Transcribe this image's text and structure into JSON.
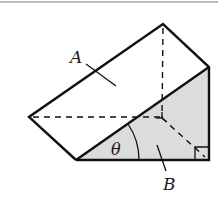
{
  "figure": {
    "labels": {
      "face_a": "A",
      "face_b": "B",
      "angle": "θ"
    },
    "colors": {
      "stroke": "#111111",
      "shaded_face": "#dcdcdc",
      "face_a_fill": "#ffffff",
      "top_rule": "#bdbdbd"
    },
    "vertices": {
      "top": [
        163,
        24
      ],
      "right_top": [
        209,
        67
      ],
      "left": [
        29,
        117
      ],
      "bottom_left": [
        76,
        160
      ],
      "bottom_right": [
        209,
        160
      ],
      "hidden": [
        162,
        118
      ]
    },
    "annotations": {
      "right_angle_marker": "bottom-right corner of face B",
      "hidden_edges": "dashed"
    }
  }
}
